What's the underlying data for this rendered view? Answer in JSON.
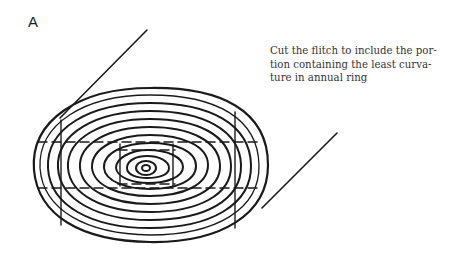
{
  "figure": {
    "panel_label": "A",
    "caption_lines": [
      "Cut the flitch to include the por-",
      "tion containing the least curva-",
      "ture in annual ring"
    ],
    "colors": {
      "ink": "#1a1a1a",
      "background": "#ffffff"
    }
  }
}
